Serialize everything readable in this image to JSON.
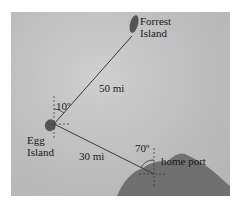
{
  "diagram": {
    "locations": {
      "forrest_island": {
        "line1": "Forrest",
        "line2": "Island"
      },
      "egg_island": {
        "line1": "Egg",
        "line2": "Island"
      },
      "home_port": {
        "label": "home port"
      }
    },
    "distances": {
      "egg_to_forrest": "50 mi",
      "egg_to_home": "30 mi"
    },
    "angles": {
      "at_egg_island": "10º",
      "at_home_port": "70º"
    },
    "colors": {
      "water": "#bdbdbd",
      "land": "#6e6e6e",
      "line": "#3a3a3a"
    }
  }
}
